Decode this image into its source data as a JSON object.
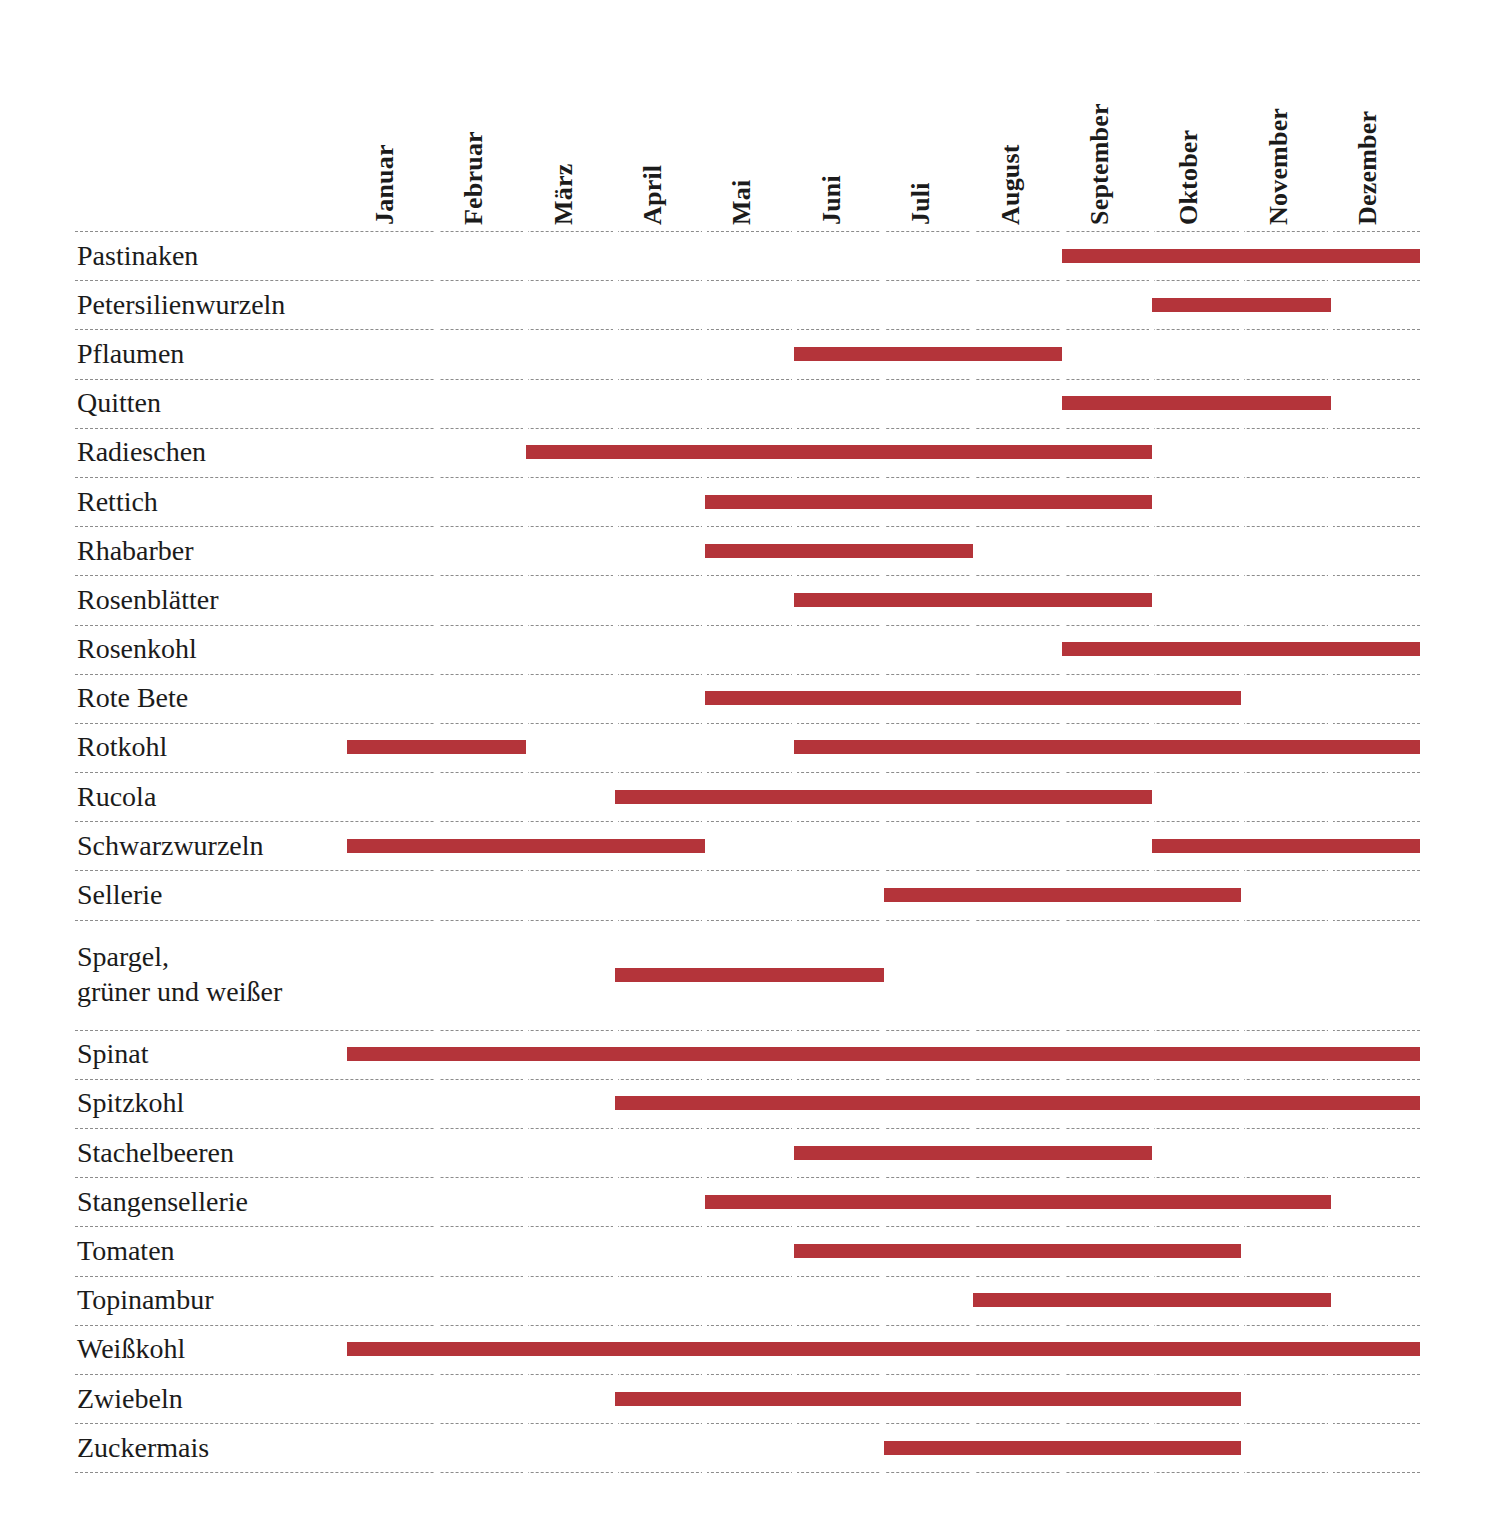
{
  "chart_data": {
    "type": "table",
    "title": "",
    "subtitle": "",
    "xlabel": "",
    "ylabel": "",
    "legend_position": "none",
    "grid": true,
    "categories": [
      "Januar",
      "Februar",
      "März",
      "April",
      "Mai",
      "Juni",
      "Juli",
      "August",
      "September",
      "Oktober",
      "November",
      "Dezember"
    ],
    "rows": [
      {
        "label": "Pastinaken",
        "spans": [
          [
            9,
            12
          ]
        ]
      },
      {
        "label": "Petersilienwurzeln",
        "spans": [
          [
            10,
            11
          ]
        ]
      },
      {
        "label": "Pflaumen",
        "spans": [
          [
            6,
            8
          ]
        ]
      },
      {
        "label": "Quitten",
        "spans": [
          [
            9,
            11
          ]
        ]
      },
      {
        "label": "Radieschen",
        "spans": [
          [
            3,
            9
          ]
        ]
      },
      {
        "label": "Rettich",
        "spans": [
          [
            5,
            9
          ]
        ]
      },
      {
        "label": "Rhabarber",
        "spans": [
          [
            5,
            7
          ]
        ]
      },
      {
        "label": "Rosenblätter",
        "spans": [
          [
            6,
            9
          ]
        ]
      },
      {
        "label": "Rosenkohl",
        "spans": [
          [
            9,
            12
          ]
        ]
      },
      {
        "label": "Rote Bete",
        "spans": [
          [
            5,
            10
          ]
        ]
      },
      {
        "label": "Rotkohl",
        "spans": [
          [
            1,
            2
          ],
          [
            6,
            12
          ]
        ]
      },
      {
        "label": "Rucola",
        "spans": [
          [
            4,
            9
          ]
        ]
      },
      {
        "label": "Schwarzwurzeln",
        "spans": [
          [
            1,
            4
          ],
          [
            10,
            12
          ]
        ]
      },
      {
        "label": "Sellerie",
        "spans": [
          [
            7,
            10
          ]
        ]
      },
      {
        "label": "Spargel,\ngrüner und weißer",
        "spans": [
          [
            4,
            6
          ]
        ]
      },
      {
        "label": "Spinat",
        "spans": [
          [
            1,
            12
          ]
        ]
      },
      {
        "label": "Spitzkohl",
        "spans": [
          [
            4,
            12
          ]
        ]
      },
      {
        "label": "Stachelbeeren",
        "spans": [
          [
            6,
            9
          ]
        ]
      },
      {
        "label": "Stangensellerie",
        "spans": [
          [
            5,
            11
          ]
        ]
      },
      {
        "label": "Tomaten",
        "spans": [
          [
            6,
            10
          ]
        ]
      },
      {
        "label": "Topinambur",
        "spans": [
          [
            8,
            11
          ]
        ]
      },
      {
        "label": "Weißkohl",
        "spans": [
          [
            1,
            12
          ]
        ]
      },
      {
        "label": "Zwiebeln",
        "spans": [
          [
            4,
            10
          ]
        ]
      },
      {
        "label": "Zuckermais",
        "spans": [
          [
            7,
            10
          ]
        ]
      }
    ]
  },
  "colors": {
    "bar": "#b4343a",
    "rule": "#8c8c8c",
    "text": "#1b1b1b",
    "background": "#ffffff"
  }
}
